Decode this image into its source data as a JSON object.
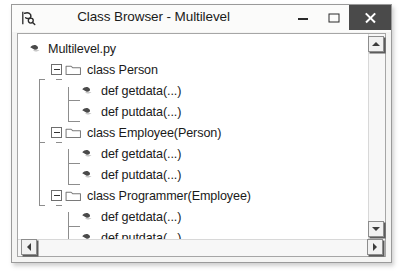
{
  "window": {
    "title": "Class Browser - Multilevel",
    "app_icon": "class-browser-icon",
    "controls": {
      "minimize": "minimize-button",
      "maximize": "maximize-button",
      "close": "close-button"
    },
    "colors": {
      "close_button_bg": "#4a4a4a",
      "titlebar_bg": "#fbfbfa",
      "client_bg": "#ffffff",
      "frame_border": "#9a9a9a",
      "scrollbar_bg": "#f7f7f7"
    }
  },
  "tree": {
    "nodes": [
      {
        "label": "Multilevel.py",
        "depth": 0,
        "icon": "python-file-icon",
        "expandable": false,
        "expanded": false
      },
      {
        "label": "class Person",
        "depth": 1,
        "icon": "folder-icon",
        "expandable": true,
        "expanded": true
      },
      {
        "label": "def getdata(...)",
        "depth": 2,
        "icon": "python-method-icon",
        "expandable": false,
        "expanded": false
      },
      {
        "label": "def putdata(...)",
        "depth": 2,
        "icon": "python-method-icon",
        "expandable": false,
        "expanded": false
      },
      {
        "label": "class Employee(Person)",
        "depth": 1,
        "icon": "folder-icon",
        "expandable": true,
        "expanded": true
      },
      {
        "label": "def getdata(...)",
        "depth": 2,
        "icon": "python-method-icon",
        "expandable": false,
        "expanded": false
      },
      {
        "label": "def putdata(...)",
        "depth": 2,
        "icon": "python-method-icon",
        "expandable": false,
        "expanded": false
      },
      {
        "label": "class Programmer(Employee)",
        "depth": 1,
        "icon": "folder-icon",
        "expandable": true,
        "expanded": true
      },
      {
        "label": "def getdata(...)",
        "depth": 2,
        "icon": "python-method-icon",
        "expandable": false,
        "expanded": false
      },
      {
        "label": "def putdata(...)",
        "depth": 2,
        "icon": "python-method-icon",
        "expandable": false,
        "expanded": false
      }
    ]
  },
  "scrollbars": {
    "vertical": {
      "up": "scroll-up-arrow",
      "down": "scroll-down-arrow"
    },
    "horizontal": {
      "left": "scroll-left-arrow",
      "right": "scroll-right-arrow"
    }
  }
}
